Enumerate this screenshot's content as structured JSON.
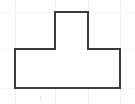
{
  "canvas": {
    "width": 135,
    "height": 104,
    "background_color": "#ffffff"
  },
  "figure": {
    "name": "t-shape-polygon",
    "outline_color": "#3b3b3b",
    "fill_color": "#ffffff",
    "stroke_width": 2,
    "vertices": [
      {
        "x": 55,
        "y": 12
      },
      {
        "x": 88,
        "y": 12
      },
      {
        "x": 88,
        "y": 49
      },
      {
        "x": 120,
        "y": 49
      },
      {
        "x": 120,
        "y": 88
      },
      {
        "x": 15,
        "y": 88
      },
      {
        "x": 15,
        "y": 49
      },
      {
        "x": 55,
        "y": 49
      }
    ],
    "path": "M55,12 L88,12 L88,49 L120,49 L120,88 L15,88 L15,49 L55,49 Z"
  },
  "grid": {
    "color": "#f0f0f0",
    "faint_color": "#f6f6f6",
    "vertical_lines": [
      15,
      55,
      88,
      120
    ],
    "horizontal_lines": [
      12,
      49,
      88
    ],
    "tick_marks": [
      {
        "x": 40,
        "y1": 96,
        "y2": 100
      }
    ]
  },
  "labels": []
}
